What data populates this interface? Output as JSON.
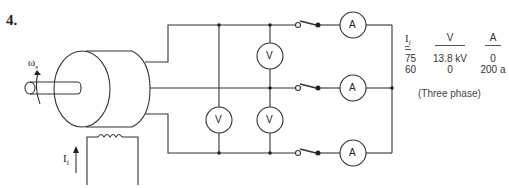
{
  "problem": {
    "number": "4."
  },
  "labels": {
    "omega": "ω",
    "omega_sub": "s",
    "field_current": "I",
    "field_current_sub": "f",
    "voltmeter": "V",
    "ammeter": "A"
  },
  "table": {
    "headers": {
      "col1": "I",
      "col1_sub": "f",
      "col2": "V",
      "col3": "A"
    },
    "rows": [
      {
        "If": "75",
        "V": "13.8 kV",
        "A": "0"
      },
      {
        "If": "60",
        "V": "0",
        "A": "200 a"
      }
    ],
    "note": "(Three phase)"
  },
  "components": {
    "voltmeters": 3,
    "ammeters": 3,
    "switches": 3
  },
  "colors": {
    "line": "#333333",
    "background": "#ffffff"
  }
}
